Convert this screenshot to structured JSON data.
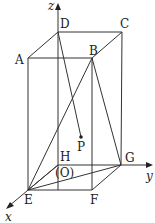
{
  "diagram": {
    "type": "rectangular-prism-with-axes",
    "vertices": {
      "A": {
        "label": "A",
        "x": 28,
        "y": 58
      },
      "B": {
        "label": "B",
        "x": 92,
        "y": 58
      },
      "C": {
        "label": "C",
        "x": 122,
        "y": 32
      },
      "D": {
        "label": "D",
        "x": 58,
        "y": 32
      },
      "E": {
        "label": "E",
        "x": 28,
        "y": 190
      },
      "F": {
        "label": "F",
        "x": 92,
        "y": 190
      },
      "G": {
        "label": "G",
        "x": 121,
        "y": 165
      },
      "H": {
        "label": "H",
        "x": 58,
        "y": 165
      },
      "P": {
        "label": "P",
        "x": 81,
        "y": 137
      }
    },
    "origin_label": "(O)",
    "axes": {
      "x": "x",
      "y": "y",
      "z": "z"
    },
    "segments": [
      "AB",
      "BC",
      "CD",
      "DA",
      "AE",
      "BF",
      "CG",
      "DH",
      "EF",
      "FG",
      "GH",
      "HE",
      "EB",
      "EG",
      "BG",
      "DP"
    ]
  }
}
